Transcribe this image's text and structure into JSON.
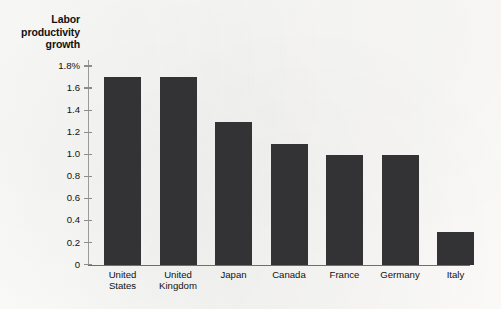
{
  "chart_data": {
    "type": "bar",
    "title": "Labor productivity growth",
    "title_lines": [
      "Labor",
      "productivity",
      "growth"
    ],
    "xlabel": "",
    "ylabel": "Labor productivity growth",
    "categories": [
      "United States",
      "United Kingdom",
      "Japan",
      "Canada",
      "France",
      "Germany",
      "Italy"
    ],
    "category_lines": [
      [
        "United",
        "States"
      ],
      [
        "United",
        "Kingdom"
      ],
      [
        "Japan",
        ""
      ],
      [
        "Canada",
        ""
      ],
      [
        "France",
        ""
      ],
      [
        "Germany",
        ""
      ],
      [
        "Italy",
        ""
      ]
    ],
    "values": [
      1.7,
      1.7,
      1.3,
      1.1,
      1.0,
      1.0,
      0.3
    ],
    "ylim": [
      0,
      1.8
    ],
    "ytick_values": [
      1.8,
      1.6,
      1.4,
      1.2,
      1.0,
      0.8,
      0.6,
      0.4,
      0.2,
      0
    ],
    "ytick_labels": [
      "1.8%",
      "1.6",
      "1.4",
      "1.2",
      "1.0",
      "0.8",
      "0.6",
      "0.4",
      "0.2",
      "0"
    ],
    "unit": "%",
    "grid": false,
    "legend": null,
    "bar_color": "#333234",
    "axis_color": "#8d8d8d",
    "background_color": "#fbfbfa"
  }
}
